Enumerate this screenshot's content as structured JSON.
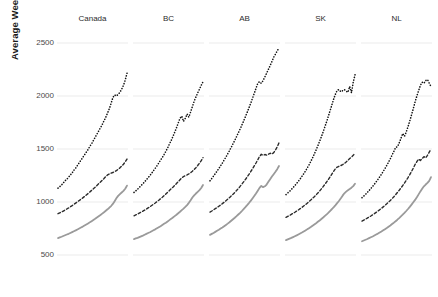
{
  "chart_data": {
    "type": "line",
    "title": "",
    "subtitle": "",
    "xlabel": "",
    "ylabel": "Average Weekly Earnings ($)",
    "ylim": [
      400,
      2600
    ],
    "yticks": [
      500,
      1000,
      1500,
      2000,
      2500
    ],
    "ytick_labels": [
      "500",
      "1000",
      "1500",
      "2000",
      "2500"
    ],
    "grid": true,
    "grid_axis": "y",
    "legend": "none",
    "legend_position": "none",
    "facet_layout": "1 row x 5 columns",
    "panels": [
      "Canada",
      "BC",
      "AB",
      "SK",
      "NL"
    ],
    "series_styles": [
      {
        "name": "series-dotted-high",
        "linestyle": "dotted",
        "color": "#111111",
        "width": 1.6
      },
      {
        "name": "series-dashed-mid",
        "linestyle": "dashed",
        "color": "#2b2b2b",
        "width": 1.4
      },
      {
        "name": "series-solid-low",
        "linestyle": "solid",
        "color": "#9a9a9a",
        "width": 1.8
      }
    ],
    "x": [
      0,
      1,
      2,
      3,
      4,
      5,
      6,
      7,
      8,
      9,
      10,
      11,
      12,
      13,
      14,
      15,
      16,
      17,
      18,
      19,
      20,
      21,
      22,
      23,
      24,
      25,
      26,
      27,
      28,
      29,
      30,
      31,
      32,
      33,
      34,
      35,
      36,
      37,
      38,
      39
    ],
    "facets": [
      {
        "panel": "Canada",
        "series": [
          {
            "name": "series-dotted-high",
            "values": [
              1130,
              1145,
              1160,
              1180,
              1200,
              1215,
              1235,
              1255,
              1275,
              1300,
              1320,
              1345,
              1370,
              1395,
              1420,
              1445,
              1470,
              1495,
              1525,
              1550,
              1580,
              1610,
              1640,
              1670,
              1700,
              1730,
              1765,
              1800,
              1840,
              1880,
              1930,
              1985,
              2010,
              2000,
              2015,
              2035,
              2065,
              2100,
              2150,
              2215
            ]
          },
          {
            "name": "series-dashed-mid",
            "values": [
              890,
              898,
              906,
              915,
              924,
              934,
              944,
              955,
              966,
              978,
              990,
              1002,
              1014,
              1026,
              1039,
              1052,
              1066,
              1080,
              1095,
              1110,
              1125,
              1140,
              1156,
              1172,
              1188,
              1205,
              1222,
              1240,
              1255,
              1265,
              1272,
              1278,
              1286,
              1296,
              1308,
              1322,
              1338,
              1356,
              1378,
              1405
            ]
          },
          {
            "name": "series-solid-low",
            "values": [
              660,
              666,
              672,
              679,
              686,
              693,
              700,
              708,
              716,
              724,
              732,
              741,
              750,
              759,
              768,
              778,
              788,
              798,
              808,
              819,
              830,
              841,
              853,
              865,
              877,
              890,
              903,
              917,
              931,
              946,
              962,
              982,
              1008,
              1035,
              1058,
              1075,
              1090,
              1105,
              1125,
              1155
            ]
          }
        ]
      },
      {
        "panel": "BC",
        "series": [
          {
            "name": "series-dotted-high",
            "values": [
              1090,
              1105,
              1120,
              1138,
              1155,
              1172,
              1190,
              1210,
              1230,
              1250,
              1272,
              1295,
              1318,
              1342,
              1368,
              1395,
              1420,
              1448,
              1478,
              1510,
              1545,
              1580,
              1618,
              1658,
              1700,
              1745,
              1790,
              1810,
              1760,
              1790,
              1830,
              1800,
              1850,
              1900,
              1950,
              1990,
              2030,
              2065,
              2100,
              2135
            ]
          },
          {
            "name": "series-dashed-mid",
            "values": [
              870,
              878,
              886,
              895,
              904,
              913,
              923,
              933,
              944,
              955,
              967,
              979,
              991,
              1004,
              1017,
              1031,
              1045,
              1060,
              1076,
              1092,
              1108,
              1124,
              1140,
              1157,
              1174,
              1192,
              1210,
              1228,
              1240,
              1248,
              1256,
              1265,
              1276,
              1290,
              1306,
              1324,
              1344,
              1366,
              1390,
              1418
            ]
          },
          {
            "name": "series-solid-low",
            "values": [
              650,
              656,
              662,
              669,
              676,
              683,
              691,
              699,
              707,
              715,
              724,
              733,
              742,
              752,
              762,
              772,
              783,
              794,
              805,
              817,
              829,
              841,
              854,
              867,
              880,
              894,
              908,
              923,
              938,
              954,
              971,
              992,
              1016,
              1042,
              1063,
              1080,
              1096,
              1112,
              1132,
              1160
            ]
          }
        ]
      },
      {
        "panel": "AB",
        "series": [
          {
            "name": "series-dotted-high",
            "values": [
              1200,
              1222,
              1245,
              1268,
              1292,
              1316,
              1342,
              1368,
              1396,
              1424,
              1454,
              1484,
              1516,
              1548,
              1582,
              1616,
              1652,
              1688,
              1726,
              1764,
              1804,
              1845,
              1888,
              1932,
              1978,
              2024,
              2072,
              2120,
              2135,
              2120,
              2145,
              2180,
              2215,
              2250,
              2288,
              2326,
              2365,
              2395,
              2425,
              2455
            ]
          },
          {
            "name": "series-dashed-mid",
            "values": [
              905,
              915,
              926,
              937,
              948,
              960,
              972,
              985,
              998,
              1012,
              1026,
              1041,
              1057,
              1073,
              1090,
              1108,
              1127,
              1147,
              1168,
              1190,
              1212,
              1236,
              1260,
              1286,
              1312,
              1340,
              1368,
              1398,
              1430,
              1450,
              1440,
              1448,
              1442,
              1450,
              1460,
              1452,
              1466,
              1490,
              1520,
              1558
            ]
          },
          {
            "name": "series-solid-low",
            "values": [
              690,
              699,
              708,
              718,
              728,
              738,
              749,
              760,
              772,
              784,
              796,
              809,
              823,
              837,
              851,
              866,
              882,
              898,
              915,
              933,
              951,
              970,
              990,
              1011,
              1033,
              1056,
              1080,
              1106,
              1133,
              1152,
              1140,
              1148,
              1165,
              1190,
              1215,
              1240,
              1262,
              1285,
              1310,
              1340
            ]
          }
        ]
      },
      {
        "panel": "SK",
        "series": [
          {
            "name": "series-dotted-high",
            "values": [
              1070,
              1085,
              1100,
              1118,
              1136,
              1155,
              1175,
              1196,
              1218,
              1242,
              1266,
              1292,
              1320,
              1350,
              1382,
              1416,
              1452,
              1490,
              1530,
              1572,
              1616,
              1662,
              1710,
              1760,
              1812,
              1866,
              1920,
              1975,
              2020,
              2055,
              2060,
              2040,
              2050,
              2060,
              2045,
              2035,
              2090,
              2030,
              2130,
              2200
            ]
          },
          {
            "name": "series-dashed-mid",
            "values": [
              855,
              864,
              873,
              883,
              893,
              903,
              914,
              925,
              937,
              949,
              962,
              975,
              989,
              1003,
              1018,
              1034,
              1050,
              1067,
              1085,
              1104,
              1124,
              1145,
              1167,
              1190,
              1214,
              1239,
              1265,
              1292,
              1315,
              1330,
              1338,
              1344,
              1352,
              1364,
              1378,
              1394,
              1410,
              1424,
              1440,
              1462
            ]
          },
          {
            "name": "series-solid-low",
            "values": [
              640,
              647,
              654,
              661,
              669,
              677,
              685,
              694,
              703,
              712,
              722,
              732,
              742,
              753,
              764,
              776,
              788,
              800,
              813,
              826,
              840,
              854,
              869,
              884,
              900,
              917,
              934,
              952,
              971,
              991,
              1012,
              1035,
              1060,
              1082,
              1098,
              1110,
              1122,
              1135,
              1150,
              1172
            ]
          }
        ]
      },
      {
        "panel": "NL",
        "series": [
          {
            "name": "series-dotted-high",
            "values": [
              1040,
              1056,
              1072,
              1090,
              1108,
              1127,
              1147,
              1168,
              1190,
              1213,
              1237,
              1262,
              1288,
              1316,
              1345,
              1376,
              1408,
              1442,
              1478,
              1516,
              1520,
              1556,
              1600,
              1646,
              1620,
              1660,
              1710,
              1765,
              1822,
              1882,
              1944,
              2000,
              2050,
              2100,
              2130,
              2120,
              2145,
              2155,
              2120,
              2090
            ]
          },
          {
            "name": "series-dashed-mid",
            "values": [
              820,
              829,
              838,
              848,
              858,
              868,
              879,
              890,
              902,
              914,
              927,
              940,
              954,
              968,
              983,
              999,
              1015,
              1032,
              1050,
              1069,
              1089,
              1110,
              1132,
              1155,
              1179,
              1204,
              1230,
              1258,
              1288,
              1320,
              1354,
              1380,
              1405,
              1392,
              1410,
              1428,
              1416,
              1440,
              1470,
              1500
            ]
          },
          {
            "name": "series-solid-low",
            "values": [
              630,
              637,
              644,
              651,
              659,
              667,
              675,
              684,
              693,
              702,
              712,
              722,
              733,
              744,
              755,
              767,
              779,
              792,
              805,
              819,
              833,
              848,
              864,
              880,
              897,
              915,
              934,
              954,
              975,
              997,
              1020,
              1045,
              1072,
              1100,
              1125,
              1148,
              1165,
              1180,
              1200,
              1235
            ]
          }
        ]
      }
    ]
  },
  "axis": {
    "ylabel": "Average Weekly Earnings ($)",
    "ytick_labels": [
      "2500",
      "2000",
      "1500",
      "1000",
      "500"
    ]
  },
  "panel_titles": [
    "Canada",
    "BC",
    "AB",
    "SK",
    "NL"
  ]
}
